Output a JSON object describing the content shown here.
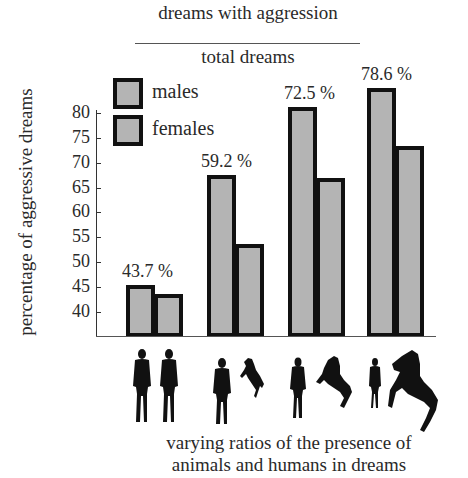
{
  "chart_data": {
    "type": "bar",
    "title": {
      "numerator": "dreams with aggression",
      "denominator": "total dreams"
    },
    "ylabel": "percentage of aggressive dreams",
    "xlabel": "varying ratios of the presence of animals and humans in dreams",
    "xlabel_lines": [
      "varying ratios of the presence of",
      "animals and humans in dreams"
    ],
    "ylim": [
      35,
      85
    ],
    "yticks": [
      40,
      45,
      50,
      55,
      60,
      65,
      70,
      75,
      80
    ],
    "grid": false,
    "legend": {
      "position": "upper-left",
      "entries": [
        "males",
        "females"
      ]
    },
    "categories": [
      "2 humans, 0 animals",
      "1 human, 1 small animal",
      "1 human, 1 medium animal",
      "1 small human, 1 large animal"
    ],
    "series": [
      {
        "name": "males",
        "values": [
          45.5,
          67.5,
          81.2,
          85.0
        ]
      },
      {
        "name": "females",
        "values": [
          43.7,
          53.7,
          66.9,
          73.3
        ]
      }
    ],
    "group_labels": [
      "43.7 %",
      "59.2 %",
      "72.5 %",
      "78.6 %"
    ]
  },
  "colors": {
    "bar_fill": "#b4b4b4",
    "bar_border": "#111111",
    "text": "#2a2a2a"
  },
  "icons": [
    "human-silhouette-icon",
    "horse-silhouette-icon"
  ]
}
